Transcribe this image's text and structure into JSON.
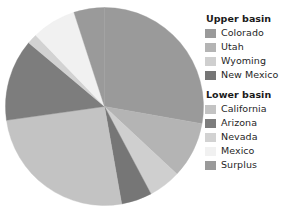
{
  "chart_data": {
    "type": "pie",
    "title": "",
    "subtitle": "",
    "xlabel": "",
    "ylabel": "",
    "grid": false,
    "legend_position": "right",
    "start_angle_deg": 0,
    "direction": "clockwise",
    "categories": [
      "Colorado",
      "Utah",
      "Wyoming",
      "New Mexico",
      "California",
      "Arizona",
      "Nevada",
      "Mexico",
      "Surplus"
    ],
    "values": [
      27.8,
      9.2,
      5.3,
      5.0,
      25.5,
      13.3,
      1.7,
      7.2,
      5.0
    ],
    "units": "percent",
    "slices": [
      {
        "label": "Colorado",
        "group": "Upper basin",
        "value": 27.8,
        "start_deg": 0.0,
        "end_deg": 100.0,
        "color": "#9a9a9a"
      },
      {
        "label": "Utah",
        "group": "Upper basin",
        "value": 9.2,
        "start_deg": 100.0,
        "end_deg": 133.0,
        "color": "#b4b4b4"
      },
      {
        "label": "Wyoming",
        "group": "Upper basin",
        "value": 5.3,
        "start_deg": 133.0,
        "end_deg": 152.0,
        "color": "#cfcfcf"
      },
      {
        "label": "New Mexico",
        "group": "Upper basin",
        "value": 5.0,
        "start_deg": 152.0,
        "end_deg": 170.0,
        "color": "#767676"
      },
      {
        "label": "California",
        "group": "Lower basin",
        "value": 25.5,
        "start_deg": 170.0,
        "end_deg": 262.0,
        "color": "#c3c3c3"
      },
      {
        "label": "Arizona",
        "group": "Lower basin",
        "value": 13.3,
        "start_deg": 262.0,
        "end_deg": 310.0,
        "color": "#7d7d7d"
      },
      {
        "label": "Nevada",
        "group": "Lower basin",
        "value": 1.7,
        "start_deg": 310.0,
        "end_deg": 316.0,
        "color": "#d2d2d2"
      },
      {
        "label": "Mexico",
        "group": "Lower basin",
        "value": 7.2,
        "start_deg": 316.0,
        "end_deg": 342.0,
        "color": "#f1f1f1"
      },
      {
        "label": "Surplus",
        "group": "Lower basin",
        "value": 5.0,
        "start_deg": 342.0,
        "end_deg": 360.0,
        "color": "#9a9a9a"
      }
    ]
  },
  "legend": {
    "groups": [
      {
        "title": "Upper basin",
        "items": [
          {
            "label": "Colorado",
            "color": "#9a9a9a"
          },
          {
            "label": "Utah",
            "color": "#b4b4b4"
          },
          {
            "label": "Wyoming",
            "color": "#cfcfcf"
          },
          {
            "label": "New Mexico",
            "color": "#767676"
          }
        ]
      },
      {
        "title": "Lower basin",
        "items": [
          {
            "label": "California",
            "color": "#c3c3c3"
          },
          {
            "label": "Arizona",
            "color": "#7d7d7d"
          },
          {
            "label": "Nevada",
            "color": "#d2d2d2"
          },
          {
            "label": "Mexico",
            "color": "#f1f1f1"
          },
          {
            "label": "Surplus",
            "color": "#9a9a9a"
          }
        ]
      }
    ]
  },
  "figure": {
    "background_color": "#ffffff",
    "text_color": "#1f1f1f"
  }
}
